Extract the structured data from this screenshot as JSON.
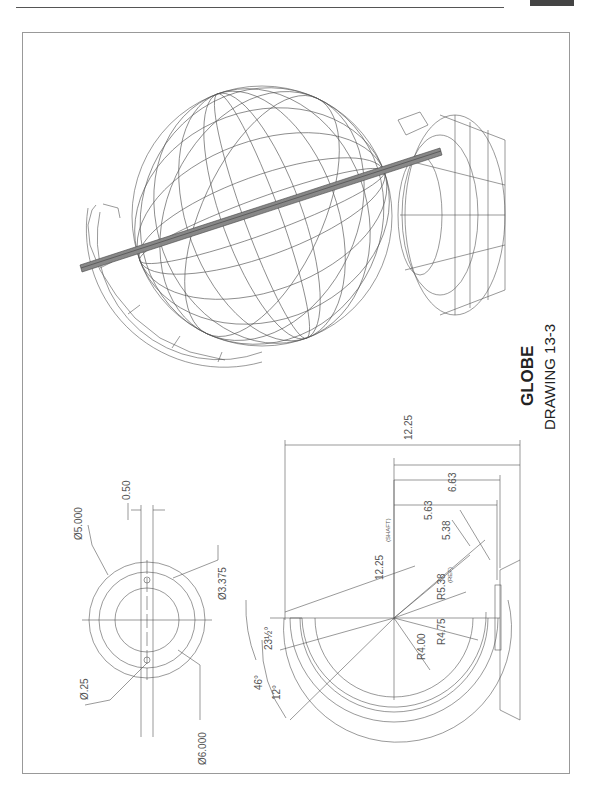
{
  "header": {
    "running_text": "",
    "tab_color": "#444444"
  },
  "title": {
    "main": "GLOBE",
    "sub": "DRAWING 13-3"
  },
  "views": {
    "isometric": {
      "label": "3D wireframe globe with axis shaft and stand"
    },
    "top_view": {
      "dims": {
        "dia_outer": "Ø6.000",
        "dia_mid": "Ø5.000",
        "dia_inner": "Ø3.375",
        "hole": "Ø.25",
        "slot": "0.50"
      }
    },
    "front_view": {
      "dims": {
        "overall": "12.25",
        "shaft": "12.25",
        "shaft_note": "(SHAFT)",
        "d663": "6.63",
        "d563": "5.63",
        "d538": "5.38",
        "r538": "R5.38",
        "ref_note": "(REF)",
        "r475": "R4.75",
        "r400": "R4.00",
        "angle_tilt": "23½°",
        "angle_46": "46°",
        "angle_12": "12°"
      }
    }
  },
  "colors": {
    "line": "#555555",
    "shaft_fill": "#888888",
    "frame": "#999999"
  }
}
